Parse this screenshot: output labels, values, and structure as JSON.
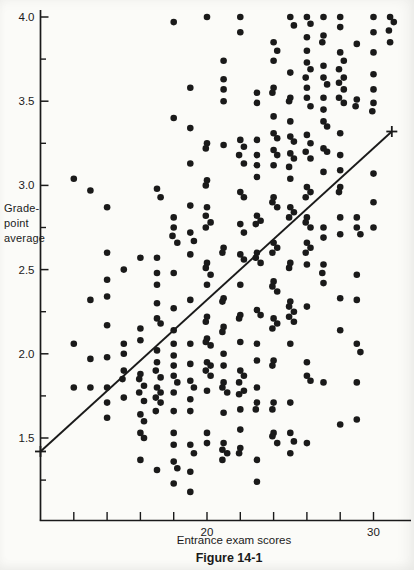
{
  "figure": {
    "caption": "Figure 14-1",
    "xlabel": "Entrance exam scores",
    "ylabel": "Grade-point average",
    "ylabel_lines": [
      "Grade-",
      "point",
      "average"
    ]
  },
  "colors": {
    "ink": "#1a1a1a",
    "paper": "#fbfbf8"
  },
  "chart_data": {
    "type": "scatter",
    "title": "Figure 14-1",
    "xlabel": "Entrance exam scores",
    "ylabel": "Grade-point average",
    "marker": "filled-circle",
    "grid": false,
    "xlim": [
      10,
      32.2
    ],
    "ylim": [
      1.0,
      4.05
    ],
    "x_ticks": [
      12,
      14,
      16,
      18,
      20,
      22,
      24,
      26,
      28,
      30
    ],
    "x_tick_labels": {
      "20": "20",
      "30": "30"
    },
    "y_major_ticks": [
      4.0,
      3.5,
      3.0,
      2.5,
      2.0,
      1.5
    ],
    "y_major_tick_labels": [
      "4.0",
      "3.5",
      "3.0",
      "2.5",
      "2.0",
      "1.5"
    ],
    "y_minor_ticks": [
      3.75,
      3.25,
      2.75,
      2.25,
      1.75,
      1.25
    ],
    "regression_line": {
      "x_start": 10,
      "y_start": 1.42,
      "x_end": 31.1,
      "y_end": 3.32,
      "endpoint_markers": "+"
    },
    "points_by_score": {
      "12": [
        3.04,
        2.06,
        1.8
      ],
      "13": [
        2.97,
        2.32,
        1.97,
        1.8
      ],
      "14": [
        2.87,
        2.6,
        2.44,
        2.34,
        2.17,
        1.98,
        1.8,
        1.71,
        1.62
      ],
      "15": [
        2.5,
        2.06,
        2.0,
        1.9,
        1.85,
        1.74
      ],
      "16": [
        2.57,
        2.15,
        2.08,
        1.88,
        1.85,
        1.81,
        1.77,
        1.72,
        1.64,
        1.6,
        1.53,
        1.5,
        1.37
      ],
      "17": [
        2.98,
        2.93,
        2.57,
        2.48,
        2.41,
        2.3,
        2.21,
        2.18,
        2.02,
        1.95,
        1.9,
        1.86,
        1.8,
        1.77,
        1.74,
        1.71,
        1.66,
        1.31
      ],
      "18": [
        3.97,
        3.4,
        2.81,
        2.75,
        2.7,
        2.66,
        2.48,
        2.27,
        2.14,
        2.06,
        1.99,
        1.93,
        1.87,
        1.83,
        1.77,
        1.66,
        1.53,
        1.46,
        1.36,
        1.32,
        1.23
      ],
      "19": [
        3.58,
        3.34,
        3.13,
        2.88,
        2.72,
        2.67,
        2.59,
        2.32,
        2.06,
        1.94,
        1.84,
        1.8,
        1.73,
        1.66,
        1.46,
        1.41,
        1.3,
        1.18
      ],
      "20": [
        4.0,
        3.25,
        3.22,
        3.03,
        3.0,
        2.87,
        2.82,
        2.78,
        2.75,
        2.54,
        2.51,
        2.47,
        2.41,
        2.22,
        2.19,
        2.09,
        2.07,
        2.05,
        1.95,
        1.93,
        1.9,
        1.87,
        1.78,
        1.53,
        1.47
      ],
      "21": [
        3.74,
        3.63,
        3.57,
        3.5,
        3.24,
        2.63,
        2.6,
        2.33,
        2.31,
        2.16,
        2.13,
        2.0,
        1.93,
        1.83,
        1.8,
        1.77,
        1.65,
        1.47,
        1.43,
        1.41,
        1.37
      ],
      "22": [
        4.0,
        3.91,
        3.27,
        3.23,
        3.18,
        3.13,
        2.96,
        2.93,
        2.77,
        2.72,
        2.59,
        2.56,
        2.41,
        2.23,
        2.21,
        2.07,
        1.9,
        1.87,
        1.83,
        1.78,
        1.76,
        1.67,
        1.55,
        1.44,
        1.41
      ],
      "23": [
        3.55,
        3.49,
        3.27,
        3.18,
        3.12,
        3.05,
        2.82,
        2.79,
        2.77,
        2.6,
        2.57,
        2.54,
        2.26,
        2.23,
        2.06,
        1.96,
        1.8,
        1.71,
        1.67,
        1.37,
        1.24
      ],
      "24": [
        3.85,
        3.8,
        3.74,
        3.58,
        3.55,
        3.41,
        3.31,
        3.28,
        3.21,
        3.18,
        3.12,
        2.93,
        2.9,
        2.87,
        2.66,
        2.63,
        2.6,
        2.43,
        2.4,
        2.37,
        2.21,
        2.18,
        2.15,
        1.96,
        1.93,
        1.71,
        1.67,
        1.53,
        1.51,
        1.47
      ],
      "25": [
        4.0,
        3.95,
        3.67,
        3.52,
        3.5,
        3.38,
        3.29,
        3.26,
        3.19,
        3.16,
        3.11,
        3.04,
        2.87,
        2.84,
        2.81,
        2.54,
        2.51,
        2.31,
        2.28,
        2.25,
        2.22,
        2.19,
        2.06,
        1.71,
        1.53,
        1.48,
        1.41
      ],
      "26": [
        4.0,
        3.96,
        3.88,
        3.8,
        3.73,
        3.69,
        3.64,
        3.58,
        3.52,
        3.47,
        3.3,
        3.25,
        3.2,
        3.16,
        2.99,
        2.96,
        2.93,
        2.81,
        2.78,
        2.75,
        2.66,
        2.63,
        2.6,
        2.53,
        2.28,
        1.95,
        1.87,
        1.84,
        1.47
      ],
      "27": [
        4.0,
        3.89,
        3.85,
        3.71,
        3.64,
        3.6,
        3.52,
        3.45,
        3.38,
        3.35,
        3.22,
        3.2,
        3.08,
        2.75,
        2.69,
        2.53,
        2.48,
        2.42,
        1.83
      ],
      "28": [
        4.0,
        3.94,
        3.79,
        3.74,
        3.69,
        3.64,
        3.61,
        3.57,
        3.52,
        3.49,
        3.31,
        3.18,
        3.09,
        2.99,
        2.96,
        2.81,
        2.71,
        2.33,
        2.14,
        1.58
      ],
      "29": [
        3.84,
        3.51,
        3.47,
        2.81,
        2.75,
        2.71,
        2.47,
        2.32,
        2.06,
        2.01,
        1.83,
        1.61
      ],
      "30": [
        4.0,
        3.91,
        3.79,
        3.66,
        3.57,
        3.49,
        3.44,
        3.07,
        2.9,
        2.75
      ],
      "31": [
        4.0,
        3.97,
        3.92,
        3.85
      ]
    }
  }
}
